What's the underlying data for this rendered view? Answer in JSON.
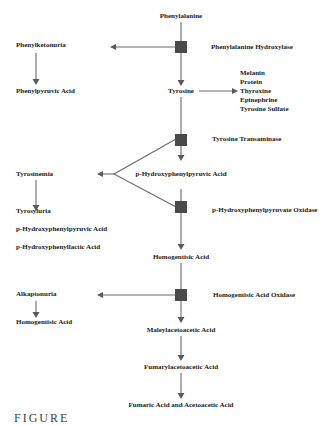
{
  "diagram": {
    "main_pathway": {
      "nodes": [
        {
          "id": "phenylalanine",
          "label": "Phenylalanine"
        },
        {
          "id": "tyrosine",
          "label": "Tyrosine"
        },
        {
          "id": "p_hppa",
          "label": "p-Hydroxyphenylpyruvic Acid"
        },
        {
          "id": "homogentisic",
          "label": "Homogentisic Acid"
        },
        {
          "id": "maleylacetoacetic",
          "label": "Maleylacetoacetic Acid"
        },
        {
          "id": "fumarylacetoacetic",
          "label": "Fumarylacetoacetic Acid"
        },
        {
          "id": "fumaric_acetoacetic",
          "label": "Fumaric Acid and Acetoacetic Acid"
        }
      ],
      "enzymes": [
        {
          "id": "pah",
          "label": "Phenylalanine Hydroxylase"
        },
        {
          "id": "tat",
          "label": "Tyrosine Transaminase"
        },
        {
          "id": "hppd",
          "label": "p-Hydroxyphenylpyruvate Oxidase"
        },
        {
          "id": "hgd",
          "label": "Homogentisic Acid Oxidase"
        }
      ]
    },
    "tyrosine_products": [
      "Melanin",
      "Protein",
      "Thyroxine",
      "Epinephrine",
      "Tyrosine Sulfate"
    ],
    "disorders": [
      {
        "name": "Phenylketonuria",
        "products": [
          "Phenylpyruvic Acid"
        ]
      },
      {
        "name": "Tyrosinemia",
        "products": [
          "Tyrosyluria",
          "p-Hydroxyphenylpyruvic Acid",
          "p-Hydroxyphenyllactic Acid"
        ]
      },
      {
        "name": "Alkaptonuria",
        "products": [
          "Homogentisic Acid"
        ]
      }
    ],
    "caption_partial": "FIGURE"
  }
}
